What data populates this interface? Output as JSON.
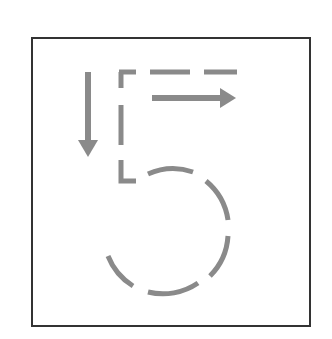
{
  "figure": {
    "digit_label": "5",
    "stroke_color": "#8a8a8a",
    "border_color": "#333333",
    "background_color": "#ffffff",
    "arrows": [
      {
        "name": "down-arrow",
        "direction": "down",
        "stroke_number": 1
      },
      {
        "name": "right-arrow",
        "direction": "right",
        "stroke_number": 2
      }
    ]
  }
}
